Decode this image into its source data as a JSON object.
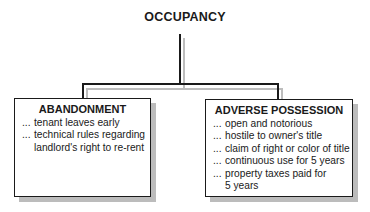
{
  "root": {
    "label": "OCCUPANCY"
  },
  "children": [
    {
      "title": "ABANDONMENT",
      "bullet": "...",
      "items": [
        "tenant leaves early",
        "technical rules regarding landlord's right to re-rent"
      ]
    },
    {
      "title": "ADVERSE POSSESSION",
      "bullet": "...",
      "items": [
        "open and notorious",
        "hostile to owner's title",
        "claim of right or color of title",
        "continuous use for 5 years",
        "property taxes paid for 5 years"
      ]
    }
  ],
  "colors": {
    "line": "#1a1a1a",
    "shadow": "#bcbcbc",
    "background": "#ffffff"
  }
}
